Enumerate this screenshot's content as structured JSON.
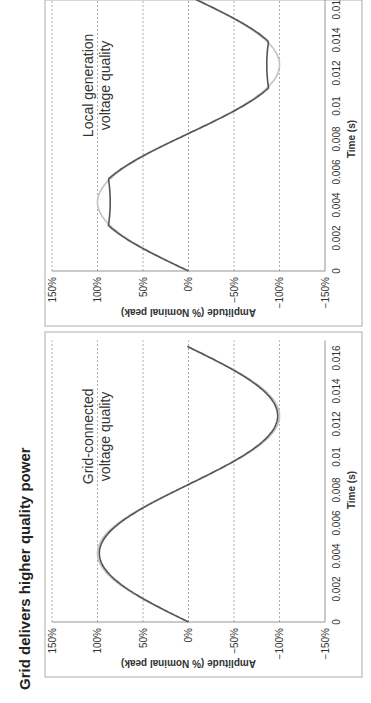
{
  "title": "Grid delivers higher quality power",
  "colors": {
    "measured_line": "#555555",
    "reference_line": "#c2c2c2",
    "gridline": "#999999",
    "panel_border": "#b9b9b9"
  },
  "panels": [
    {
      "id": "grid",
      "annotation_line1": "Grid-connected",
      "annotation_line2": "voltage quality",
      "ylabel": "Amplitude (% Nominal peak)",
      "xlabel": "Time (s)",
      "yticks": [
        "150%",
        "100%",
        "50%",
        "0%",
        "-50%",
        "-100%",
        "-150%"
      ],
      "xticks": [
        "0",
        "0.002",
        "0.004",
        "0.006",
        "0.008",
        "0.01",
        "0.012",
        "0.014",
        "0.016"
      ]
    },
    {
      "id": "local",
      "annotation_line1": "Local generation",
      "annotation_line2": "voltage quality",
      "ylabel": "Amplitude (% Nominal peak)",
      "xlabel": "Time (s)",
      "yticks": [
        "150%",
        "100%",
        "50%",
        "0%",
        "-50%",
        "-100%",
        "-150%"
      ],
      "xticks": [
        "0",
        "0.002",
        "0.004",
        "0.006",
        "0.008",
        "0.01",
        "0.012",
        "0.014",
        "0.016"
      ]
    }
  ],
  "chart_data": [
    {
      "type": "line",
      "title": "Grid-connected voltage quality",
      "xlabel": "Time (s)",
      "ylabel": "Amplitude (% Nominal peak)",
      "xlim": [
        0,
        0.0167
      ],
      "ylim": [
        -150,
        150
      ],
      "grid": true,
      "x": [
        0,
        0.001,
        0.002,
        0.003,
        0.004,
        0.005,
        0.006,
        0.007,
        0.008,
        0.009,
        0.01,
        0.011,
        0.012,
        0.013,
        0.014,
        0.015,
        0.016,
        0.0167
      ],
      "series": [
        {
          "name": "Reference sine (nominal)",
          "values": [
            0,
            37,
            68,
            90,
            100,
            95,
            77,
            48,
            13,
            -24,
            -58,
            -85,
            -99,
            -98,
            -85,
            -59,
            -24,
            0
          ]
        },
        {
          "name": "Measured voltage",
          "values": [
            0,
            36,
            67,
            89,
            98,
            94,
            76,
            47,
            13,
            -24,
            -57,
            -84,
            -97,
            -97,
            -84,
            -58,
            -24,
            0
          ]
        }
      ]
    },
    {
      "type": "line",
      "title": "Local generation voltage quality",
      "xlabel": "Time (s)",
      "ylabel": "Amplitude (% Nominal peak)",
      "xlim": [
        0,
        0.0167
      ],
      "ylim": [
        -150,
        150
      ],
      "grid": true,
      "x": [
        0,
        0.001,
        0.002,
        0.003,
        0.004,
        0.005,
        0.006,
        0.007,
        0.008,
        0.009,
        0.01,
        0.011,
        0.012,
        0.013,
        0.014,
        0.015,
        0.016,
        0.0167
      ],
      "series": [
        {
          "name": "Reference sine (nominal)",
          "values": [
            0,
            37,
            68,
            90,
            100,
            95,
            77,
            48,
            13,
            -24,
            -58,
            -85,
            -99,
            -98,
            -85,
            -59,
            -24,
            0
          ]
        },
        {
          "name": "Measured voltage (flat-topped)",
          "values": [
            0,
            36,
            68,
            86,
            87,
            88,
            78,
            48,
            13,
            -24,
            -58,
            -84,
            -88,
            -87,
            -86,
            -58,
            -24,
            0
          ]
        }
      ]
    }
  ]
}
